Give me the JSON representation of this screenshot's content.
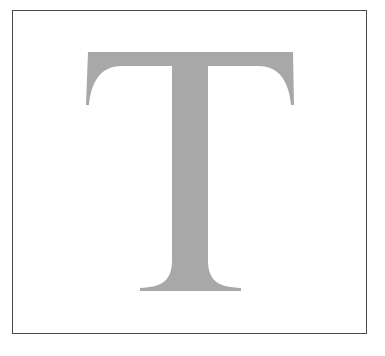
{
  "figure": {
    "letter": "T",
    "letter_color": "#a8a8a8",
    "border_color": "#4a4a4a",
    "background_color": "#ffffff"
  }
}
